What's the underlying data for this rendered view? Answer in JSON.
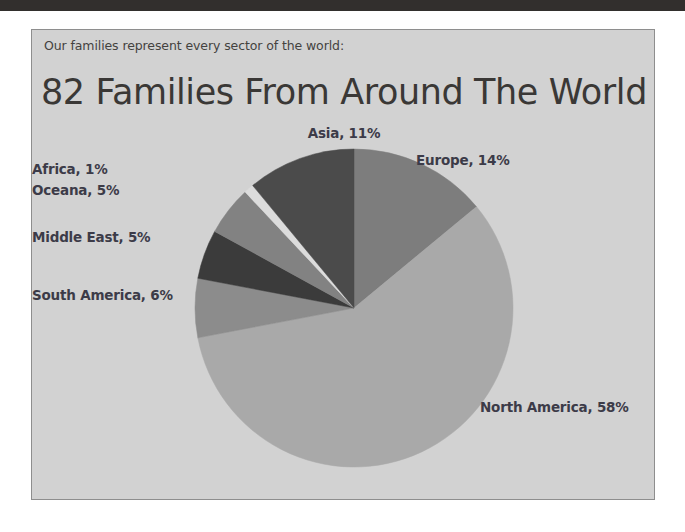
{
  "document": {
    "top_bar_color": "#322f2d",
    "panel_bg_color": "#d2d2d2",
    "panel_border_color": "#8e8e8e"
  },
  "slide": {
    "subtitle": "Our families represent every sector of the world:",
    "title": "82 Families From Around The World"
  },
  "chart_data": {
    "type": "pie",
    "title": "82 Families From Around The World",
    "subtitle": "Our families represent every sector of the world:",
    "xlabel": "",
    "ylabel": "",
    "legend": "none (direct labels)",
    "grid": false,
    "total_families": 82,
    "units": "percent",
    "start_angle_deg": 0,
    "direction": "clockwise",
    "categories": [
      "Europe",
      "North America",
      "South America",
      "Middle East",
      "Oceana",
      "Africa",
      "Asia"
    ],
    "values": [
      14,
      58,
      6,
      5,
      5,
      1,
      11
    ],
    "colors": [
      "#7d7d7d",
      "#a9a9a9",
      "#8c8c8c",
      "#3b3b3b",
      "#828282",
      "#dcdcdc",
      "#4b4b4b"
    ],
    "labels": [
      "Europe, 14%",
      "North America, 58%",
      "South America, 6%",
      "Middle East, 5%",
      "Oceana, 5%",
      "Africa, 1%",
      "Asia, 11%"
    ],
    "slices": [
      {
        "name": "Europe",
        "value": 14,
        "label": "Europe, 14%",
        "color": "#7d7d7d"
      },
      {
        "name": "North America",
        "value": 58,
        "label": "North America, 58%",
        "color": "#a9a9a9"
      },
      {
        "name": "South America",
        "value": 6,
        "label": "South America, 6%",
        "color": "#8c8c8c"
      },
      {
        "name": "Middle East",
        "value": 5,
        "label": "Middle East, 5%",
        "color": "#3b3b3b"
      },
      {
        "name": "Oceana",
        "value": 5,
        "label": "Oceana, 5%",
        "color": "#828282"
      },
      {
        "name": "Africa",
        "value": 1,
        "label": "Africa, 1%",
        "color": "#dcdcdc"
      },
      {
        "name": "Asia",
        "value": 11,
        "label": "Asia, 11%",
        "color": "#4b4b4b"
      }
    ]
  }
}
